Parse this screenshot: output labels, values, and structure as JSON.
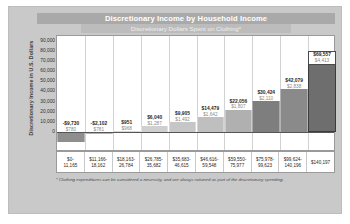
{
  "chart_data": {
    "type": "bar",
    "title": "Discretionary Income by Household Income",
    "subtitle": "Discretionary Dollars Spent on Clothing*",
    "xlabel": "",
    "ylabel": "Discretionary Income in U.S. Dollars",
    "ylim": [
      -20000,
      95000
    ],
    "yticks": [
      90000,
      80000,
      70000,
      60000,
      50000,
      40000,
      30000,
      20000,
      10000,
      0
    ],
    "ytick_labels": [
      "90,000",
      "80,000",
      "70,000",
      "60,000",
      "50,000",
      "40,000",
      "30,000",
      "20,000",
      "10,000",
      "0"
    ],
    "grid": true,
    "legend": "none",
    "categories": [
      "$0-11,165",
      "$11,166-18,162",
      "$18,163-26,784",
      "$26,785-35,682",
      "$35,683-46,615",
      "$46,616-59,548",
      "$59,550-75,977",
      "$75,978-99,623",
      "$99,624-140,196",
      "$140,197"
    ],
    "category_lines": [
      [
        "$0-",
        "11,165"
      ],
      [
        "$11,166-",
        "18,162"
      ],
      [
        "$18,163-",
        "26,784"
      ],
      [
        "$26,785-",
        "35,682"
      ],
      [
        "$35,683-",
        "46,615"
      ],
      [
        "$46,616-",
        "59,548"
      ],
      [
        "$59,550-",
        "75,977"
      ],
      [
        "$75,978-",
        "99,623"
      ],
      [
        "$99,624-",
        "140,196"
      ],
      [
        "$140,197",
        ""
      ]
    ],
    "series": [
      {
        "name": "Discretionary Income",
        "values": [
          -9730,
          -2102,
          951,
          6040,
          9905,
          14479,
          22056,
          30424,
          42079,
          69557
        ]
      },
      {
        "name": "Discretionary Dollars Spent on Clothing",
        "values": [
          780,
          781,
          968,
          1287,
          1492,
          1642,
          1807,
          2110,
          2838,
          4413
        ]
      }
    ],
    "bars": [
      {
        "category": "$0-11,165",
        "income": -9730,
        "income_label": "-$9,730",
        "clothing": 780,
        "clothing_label": "$780",
        "color": "#8e8e8e",
        "highlight": false
      },
      {
        "category": "$11,166-18,162",
        "income": -2102,
        "income_label": "-$2,102",
        "clothing": 781,
        "clothing_label": "$781",
        "color": "#b4b4b4",
        "highlight": false
      },
      {
        "category": "$18,163-26,784",
        "income": 951,
        "income_label": "$951",
        "clothing": 968,
        "clothing_label": "$968",
        "color": "#d8d8d8",
        "highlight": false
      },
      {
        "category": "$26,785-35,682",
        "income": 6040,
        "income_label": "$6,040",
        "clothing": 1287,
        "clothing_label": "$1,287",
        "color": "#cfcfcf",
        "highlight": false
      },
      {
        "category": "$35,683-46,615",
        "income": 9905,
        "income_label": "$9,905",
        "clothing": 1492,
        "clothing_label": "$1,492",
        "color": "#c6c6c6",
        "highlight": false
      },
      {
        "category": "$46,616-59,548",
        "income": 14479,
        "income_label": "$14,479",
        "clothing": 1642,
        "clothing_label": "$1,642",
        "color": "#bfbfbf",
        "highlight": false
      },
      {
        "category": "$59,550-75,977",
        "income": 22056,
        "income_label": "$22,056",
        "clothing": 1807,
        "clothing_label": "$1,807",
        "color": "#b0b0b0",
        "highlight": false
      },
      {
        "category": "$75,978-99,623",
        "income": 30424,
        "income_label": "$30,424",
        "clothing": 2110,
        "clothing_label": "$2,110",
        "color": "#7e7e7e",
        "highlight": false
      },
      {
        "category": "$99,624-140,196",
        "income": 42079,
        "income_label": "$42,079",
        "clothing": 2838,
        "clothing_label": "$2,838",
        "color": "#8a8a8a",
        "highlight": false
      },
      {
        "category": "$140,197",
        "income": 69557,
        "income_label": "$69,557",
        "clothing": 4413,
        "clothing_label": "$4,413",
        "color": "#6e6e6e",
        "highlight": true
      }
    ],
    "footnote": "* Clothing expenditures can be considered a necessity, and are always rationed as part of the discretionary spending.",
    "colors": {
      "panel_background": "#c9c9c9",
      "title_bar": "#a9a9a9",
      "subtitle_bar": "#bcbcbc",
      "plot_background": "#ffffff",
      "highlight_border": "#3c3c3c",
      "zero_line": "#555555"
    }
  }
}
